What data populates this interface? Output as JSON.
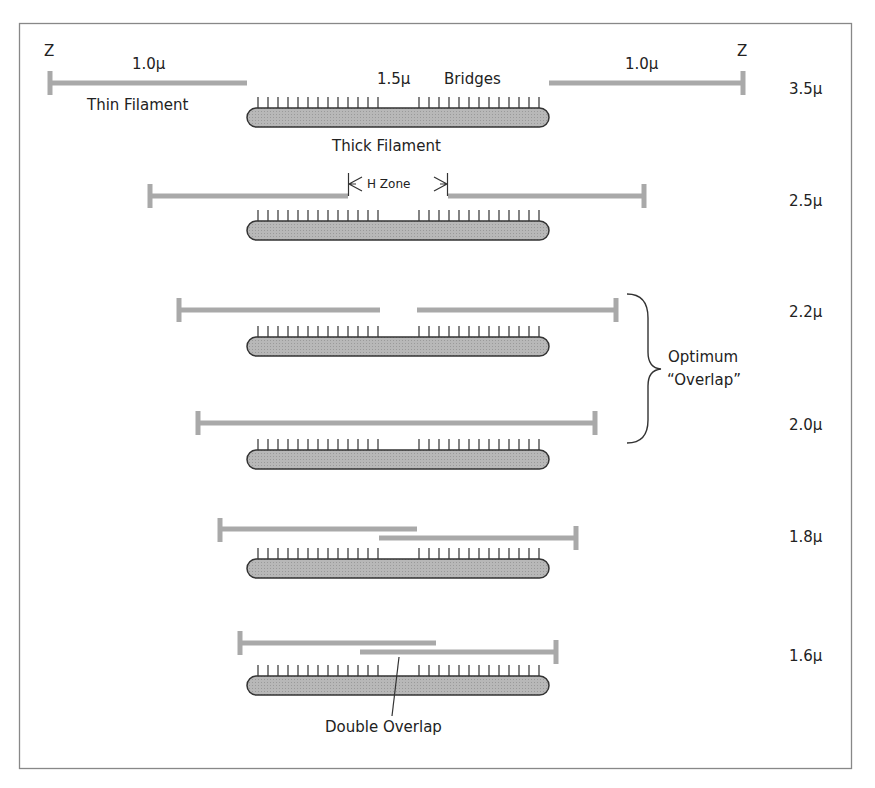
{
  "diagram": {
    "type": "sarcomere-length-overlap",
    "labels": {
      "z_left": "Z",
      "z_right": "Z",
      "thin_len_left": "1.0μ",
      "thin_len_right": "1.0μ",
      "thick_len": "1.5μ",
      "bridges": "Bridges",
      "thin_filament": "Thin Filament",
      "thick_filament": "Thick Filament",
      "h_zone": "H Zone",
      "optimum_line1": "Optimum",
      "optimum_line2": "“Overlap”",
      "double_overlap": "Double Overlap"
    },
    "rows": [
      {
        "sarcomere_length": "3.5μ"
      },
      {
        "sarcomere_length": "2.5μ"
      },
      {
        "sarcomere_length": "2.2μ"
      },
      {
        "sarcomere_length": "2.0μ"
      },
      {
        "sarcomere_length": "1.8μ"
      },
      {
        "sarcomere_length": "1.6μ"
      }
    ],
    "colors": {
      "thin_filament": "#a9a9a9",
      "thick_filament_fill": "#b3b3b3",
      "outline": "#333333",
      "frame": "#888888"
    }
  }
}
